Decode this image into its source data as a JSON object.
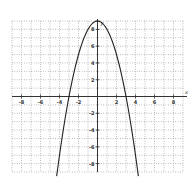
{
  "chart_data": {
    "type": "line",
    "title": "",
    "function": "y = 9 - x^2",
    "xlabel": "x",
    "ylabel": "y",
    "xlim": [
      -9,
      9
    ],
    "ylim": [
      -9,
      9
    ],
    "grid": true,
    "grid_style": "dotted",
    "x_ticks": [
      -8,
      -6,
      -4,
      -2,
      2,
      4,
      6,
      8
    ],
    "y_ticks": [
      -8,
      -6,
      -4,
      -2,
      2,
      4,
      6,
      8
    ],
    "x_tick_labels": [
      "-8",
      "-6",
      "-4",
      "-2",
      "2",
      "4",
      "6",
      "8"
    ],
    "y_tick_labels": [
      "-8",
      "-6",
      "-4",
      "-2",
      "2",
      "4",
      "6",
      "8"
    ],
    "vertex": [
      0,
      9
    ],
    "x_intercepts": [
      -3,
      3
    ],
    "series": [
      {
        "name": "parabola",
        "x": [
          -4.3,
          -4,
          -3.5,
          -3,
          -2.5,
          -2,
          -1.5,
          -1,
          -0.5,
          0,
          0.5,
          1,
          1.5,
          2,
          2.5,
          3,
          3.5,
          4,
          4.3
        ],
        "y": [
          -9.49,
          -7,
          -3.25,
          0,
          2.75,
          5,
          6.75,
          8,
          8.75,
          9,
          8.75,
          8,
          6.75,
          5,
          2.75,
          0,
          -3.25,
          -7,
          -9.49
        ]
      }
    ],
    "legend": "none"
  }
}
